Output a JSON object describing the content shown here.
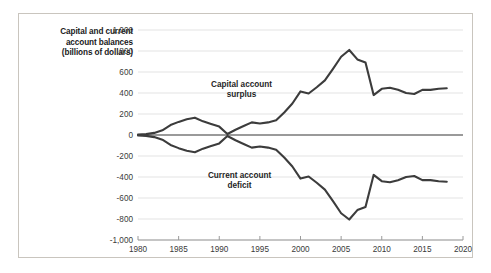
{
  "figure": {
    "border_color": "#c9c5be",
    "background": "#ffffff"
  },
  "axis_title": {
    "line1": "Capital and current",
    "line2": "account balances",
    "line3": "(billions of dollars)"
  },
  "labels": {
    "capital_line1": "Capital account",
    "capital_line2": "surplus",
    "current_line1": "Current account",
    "current_line2": "deficit"
  },
  "chart_data": {
    "type": "line",
    "title": "Capital and current account balances (billions of dollars)",
    "xlabel": "",
    "ylabel": "Capital and current account balances (billions of dollars)",
    "xlim": [
      1980,
      2020
    ],
    "ylim": [
      -1000,
      1000
    ],
    "xticks": [
      1980,
      1985,
      1990,
      1995,
      2000,
      2005,
      2010,
      2015,
      2020
    ],
    "yticks": [
      1000,
      800,
      600,
      400,
      200,
      0,
      -200,
      -400,
      -600,
      -800,
      -1000
    ],
    "ytick_labels": [
      "1,000",
      "800",
      "600",
      "400",
      "200",
      "0",
      "-200",
      "-400",
      "-600",
      "-800",
      "-1,000"
    ],
    "xtick_labels": [
      "1980",
      "1985",
      "1990",
      "1995",
      "2000",
      "2005",
      "2010",
      "2015",
      "2020"
    ],
    "grid": true,
    "grid_color": "#e3e3e3",
    "zero_line_color": "#9a9a9a",
    "legend_position": "inline-annotations",
    "line_color": "#3c3c3c",
    "line_width": 2.1,
    "x": [
      1980,
      1981,
      1982,
      1983,
      1984,
      1985,
      1986,
      1987,
      1988,
      1989,
      1990,
      1991,
      1992,
      1993,
      1994,
      1995,
      1996,
      1997,
      1998,
      1999,
      2000,
      2001,
      2002,
      2003,
      2004,
      2005,
      2006,
      2007,
      2008,
      2009,
      2010,
      2011,
      2012,
      2013,
      2014,
      2015,
      2016,
      2017,
      2018
    ],
    "series": [
      {
        "name": "Capital account surplus",
        "values": [
          5,
          8,
          20,
          45,
          95,
          125,
          150,
          165,
          130,
          105,
          80,
          10,
          50,
          85,
          120,
          110,
          120,
          140,
          215,
          300,
          415,
          395,
          455,
          520,
          630,
          745,
          810,
          720,
          690,
          380,
          440,
          450,
          430,
          400,
          390,
          430,
          430,
          440,
          445
        ]
      },
      {
        "name": "Current account deficit",
        "values": [
          -5,
          -8,
          -20,
          -45,
          -95,
          -125,
          -150,
          -165,
          -130,
          -105,
          -80,
          -10,
          -50,
          -85,
          -120,
          -110,
          -120,
          -140,
          -215,
          -300,
          -415,
          -395,
          -455,
          -520,
          -630,
          -745,
          -805,
          -715,
          -685,
          -380,
          -440,
          -450,
          -430,
          -400,
          -390,
          -430,
          -430,
          -440,
          -445
        ]
      }
    ]
  }
}
